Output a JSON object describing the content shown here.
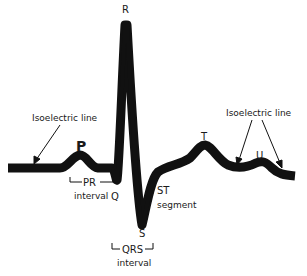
{
  "diagram": {
    "type": "ecg-waveform",
    "colors": {
      "trace": "#111111",
      "background": "#ffffff",
      "text": "#1a1a1a"
    },
    "waves": {
      "P": "P",
      "Q": "Q",
      "R": "R",
      "S": "S",
      "T": "T",
      "U": "U"
    },
    "annotations": {
      "isoelectric_left": "Isoelectric line",
      "isoelectric_right": "Isoelectric line",
      "pr_interval_top": "PR",
      "pr_interval_bottom": "interval",
      "qrs_interval_top": "QRS",
      "qrs_interval_bottom": "interval",
      "st_segment_top": "ST",
      "st_segment_bottom": "segment"
    }
  }
}
